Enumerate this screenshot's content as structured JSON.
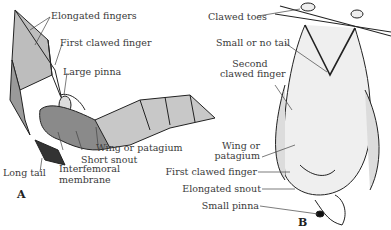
{
  "figure": {
    "panel_a": {
      "letter": "A",
      "labels": {
        "elongated_fingers": "Elongated fingers",
        "first_clawed_finger": "First clawed finger",
        "large_pinna": "Large pinna",
        "wing_or_patagium": "Wing or patagium",
        "short_snout": "Short snout",
        "long_tail": "Long tail",
        "interfemoral_1": "Interfemoral",
        "interfemoral_2": "membrane"
      }
    },
    "panel_b": {
      "letter": "B",
      "labels": {
        "clawed_toes": "Clawed toes",
        "small_or_no_tail": "Small or no tail",
        "second_clawed_1": "Second",
        "second_clawed_2": "clawed finger",
        "wing_1": "Wing or",
        "wing_2": "patagium",
        "first_clawed_finger": "First clawed finger",
        "elongated_snout": "Elongated snout",
        "small_pinna": "Small pinna"
      }
    }
  }
}
